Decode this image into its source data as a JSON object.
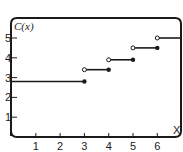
{
  "chart_data": {
    "type": "line",
    "subtype": "step-function",
    "title": "",
    "ylabel": "C(x)",
    "xlabel": "X",
    "xlim": [
      0,
      7
    ],
    "ylim": [
      0,
      6
    ],
    "grid": false,
    "legend": null,
    "x_ticks": [
      "1",
      "2",
      "3",
      "4",
      "5",
      "6"
    ],
    "y_ticks": [
      "1",
      "2",
      "3",
      "4",
      "5"
    ],
    "steps": [
      {
        "x_start": 0,
        "x_end": 3,
        "value": 2.8,
        "start_open": false,
        "end_closed": true
      },
      {
        "x_start": 3,
        "x_end": 4,
        "value": 3.4,
        "start_open": true,
        "end_closed": true
      },
      {
        "x_start": 4,
        "x_end": 5,
        "value": 3.9,
        "start_open": true,
        "end_closed": true
      },
      {
        "x_start": 5,
        "x_end": 6,
        "value": 4.5,
        "start_open": true,
        "end_closed": true
      },
      {
        "x_start": 6,
        "x_end": 7,
        "value": 5.0,
        "start_open": true,
        "end_closed": false
      }
    ]
  },
  "labels": {
    "y_axis": "C(x)",
    "x_axis": "X",
    "x_ticks": [
      "1",
      "2",
      "3",
      "4",
      "5",
      "6"
    ],
    "y_ticks": [
      "1",
      "2",
      "3",
      "4",
      "5"
    ]
  },
  "colors": {
    "line": "#1a1a1a",
    "background": "#ffffff"
  }
}
